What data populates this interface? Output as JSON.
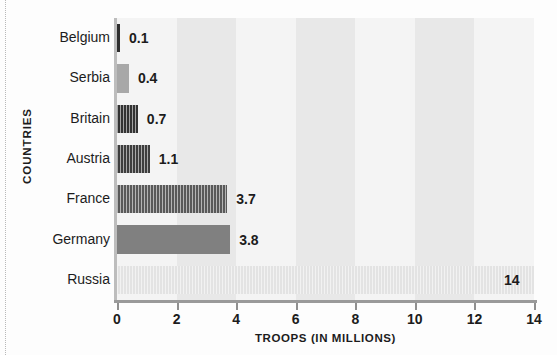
{
  "chart_data": {
    "type": "bar",
    "orientation": "horizontal",
    "title": "",
    "xlabel": "TROOPS (IN MILLIONS)",
    "ylabel": "COUNTRIES",
    "categories": [
      "Belgium",
      "Serbia",
      "Britain",
      "Austria",
      "France",
      "Germany",
      "Russia"
    ],
    "values": [
      0.1,
      0.4,
      0.7,
      1.1,
      3.7,
      3.8,
      14
    ],
    "value_labels": [
      "0.1",
      "0.4",
      "0.7",
      "1.1",
      "3.7",
      "3.8",
      "14"
    ],
    "bar_colors": [
      "#2e2e2e",
      "#a8a8a8",
      "#333333",
      "#3d3d3d",
      "#595959",
      "#808080",
      "#e3e3e3"
    ],
    "bar_striped": [
      false,
      false,
      true,
      true,
      true,
      false,
      true
    ],
    "label_inside": [
      false,
      false,
      false,
      false,
      false,
      false,
      true
    ],
    "xlim": [
      0,
      14
    ],
    "xticks": [
      0,
      2,
      4,
      6,
      8,
      10,
      12,
      14
    ],
    "xtick_labels": [
      "0",
      "2",
      "4",
      "6",
      "8",
      "10",
      "12",
      "14"
    ],
    "grid": false,
    "bands": true,
    "band_colors": [
      "#f4f4f4",
      "#e8e8e8"
    ],
    "band_width_units": 2,
    "legend": null
  }
}
